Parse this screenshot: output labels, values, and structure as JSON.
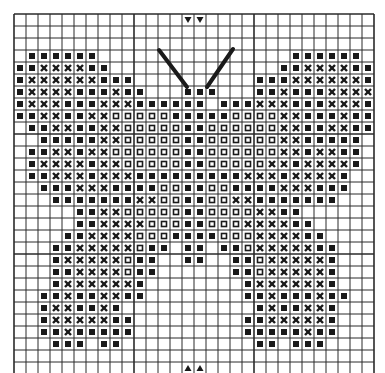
{
  "grid": {
    "cols": 30,
    "rows": 30,
    "origin_x": 14,
    "origin_y": 14,
    "cell": 12,
    "legend": {
      ".": "empty",
      "S": "solid-square",
      "X": "cross",
      "O": "open-square"
    },
    "colors": {
      "ink": "#1a1a1a",
      "line": "#2a2a2a",
      "background": "#ffffff"
    },
    "cells": [
      "..............................",
      "..............................",
      "..............................",
      ".SSSSSS................SSSSSS.",
      "SSXXXXSS..............SSXXXXSS",
      "SXXXXXXSSS..........SSSXXXXXXS",
      "SXXXXSSSXSS...SSS...SSXSSSXXXXS",
      "SXXXSSSXXXSSSSSS.SSSXXXSSSXXXS",
      "SSXXSSXXOOOOOSSSSSOOOOXXSSSXSS",
      ".SSXXSSXXOOOOOSSOOOOOOXXSSXXSS.",
      "..SSSSSXXOOOOOSSOOOOOOXXSSSSS.",
      ".SSXXSXXOOOOOOSSOOOOOOXXSXXSS.",
      ".SXXXXSXXOOOOOSSOOOOOXXSXXXXS.",
      ".SSXXXSXXXSSSSSSSSSXXXSXXXXS..",
      "..SSSXXXSSSSOOSSOOSSSSXXXSSS..",
      "...SSSSSSSXXOOSSOOXXSSSSSSS...",
      ".....SSXXOOOOOSSOOOOXXSS......",
      ".....SSXXXXOOOSSOOOXXXXSS.....",
      "....SSXXXXOOOSSSSOOOXXXXSS....",
      "...SSXXXXXOSS.SS.SSOXXXXXSS...",
      "...SXXXXXOSS..SS..SSOXXXXXS...",
      "...SSXXXXOSS......SSOXXXXXS...",
      "...SXXXXXXS........SXXXXXXS...",
      "..SSXSSXXSS........SSXSSSXSS..",
      "..SXXSSXS...........SXSSXXS...",
      "..SXXXXXSS.........SSXXXXXS...",
      "..SSXSSSSS.........SSSSSXSS...",
      "...SSS.SS...........SS.SSS....",
      "..............................",
      ".............................."
    ]
  },
  "antennae": [
    {
      "x1": 159,
      "y1": 50,
      "x2": 187,
      "y2": 87
    },
    {
      "x1": 233,
      "y1": 49,
      "x2": 207,
      "y2": 87
    }
  ],
  "center_markers": {
    "top": {
      "glyph": "▼",
      "cols": [
        14,
        15
      ],
      "row": 0
    },
    "bottom": {
      "glyph": "▲",
      "cols": [
        14,
        15
      ],
      "row": 29
    }
  }
}
